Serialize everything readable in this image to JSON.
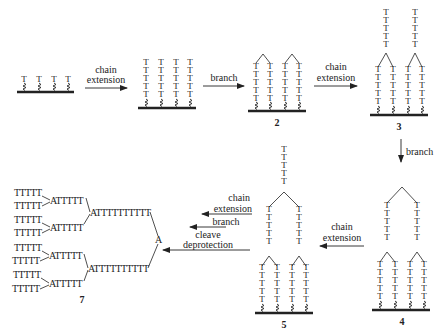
{
  "diagram": {
    "type": "synthesis-scheme",
    "nucleotide_symbol": "T",
    "branch_symbol": "A",
    "colors": {
      "ink": "#222222",
      "background": "#ffffff"
    },
    "steps": [
      {
        "from": "1",
        "to": "1b",
        "label_lines": [
          "chain",
          "extension"
        ],
        "direction": "right"
      },
      {
        "from": "1b",
        "to": "2",
        "label_lines": [
          "branch"
        ],
        "direction": "right"
      },
      {
        "from": "2",
        "to": "3",
        "label_lines": [
          "chain",
          "extension"
        ],
        "direction": "right"
      },
      {
        "from": "3",
        "to": "4",
        "label_lines": [
          "branch"
        ],
        "direction": "down"
      },
      {
        "from": "4",
        "to": "5",
        "label_lines": [
          "chain",
          "extension"
        ],
        "direction": "left"
      },
      {
        "from": "5",
        "to": "7",
        "label_lines": [
          "chain extension",
          "branch",
          "cleave deprotection"
        ],
        "direction": "left"
      }
    ],
    "compound_labels": {
      "c2": "2",
      "c3": "3",
      "c4": "4",
      "c5": "5",
      "c7": "7"
    },
    "arrows": {
      "a1": {
        "l1": "chain",
        "l2": "extension"
      },
      "a2": {
        "l1": "branch"
      },
      "a3": {
        "l1": "chain",
        "l2": "extension"
      },
      "a4": {
        "l1": "branch"
      },
      "a5": {
        "l1": "chain",
        "l2": "extension"
      },
      "a6": {
        "l1": "chain",
        "l2": "extension",
        "l3": "branch",
        "l4": "cleave",
        "l5": "deprotection"
      }
    },
    "product7": {
      "leaf": "TTTTT",
      "mid": "ATTTTT",
      "trunk": "ATTTTTTTTTT",
      "core": "A"
    }
  }
}
